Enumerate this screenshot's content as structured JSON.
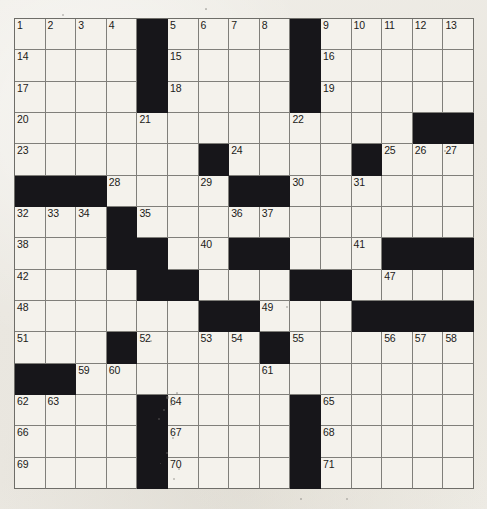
{
  "puzzle": {
    "kind": "crossword-grid",
    "title": "Crossword Puzzle Grid",
    "rows": 15,
    "columns": 15,
    "colors": {
      "block": "#17161a",
      "cell": "#f4f2ec",
      "grid_line": "#807f7a",
      "border": "#6e6d68",
      "paper": "#eceae4",
      "number_text": "#1b1a18"
    },
    "highest_number": 71,
    "layout": [
      "....#....#.....",
      "....#....#.....",
      "....#....#.....",
      ".............##",
      "......#....#...",
      "###....##......",
      "...#...........",
      "...##..##...###",
      "....##...##....",
      "......##...####",
      "...#....#......",
      "##.............",
      "....#....#.....",
      "....#....#.....",
      "....#....#....."
    ],
    "numbers": [
      {
        "n": 1,
        "row": 1,
        "col": 1
      },
      {
        "n": 2,
        "row": 1,
        "col": 2
      },
      {
        "n": 3,
        "row": 1,
        "col": 3
      },
      {
        "n": 4,
        "row": 1,
        "col": 4
      },
      {
        "n": 5,
        "row": 1,
        "col": 6
      },
      {
        "n": 6,
        "row": 1,
        "col": 7
      },
      {
        "n": 7,
        "row": 1,
        "col": 8
      },
      {
        "n": 8,
        "row": 1,
        "col": 9
      },
      {
        "n": 9,
        "row": 1,
        "col": 11
      },
      {
        "n": 10,
        "row": 1,
        "col": 12
      },
      {
        "n": 11,
        "row": 1,
        "col": 13
      },
      {
        "n": 12,
        "row": 1,
        "col": 14
      },
      {
        "n": 13,
        "row": 1,
        "col": 15
      },
      {
        "n": 14,
        "row": 2,
        "col": 1
      },
      {
        "n": 15,
        "row": 2,
        "col": 6
      },
      {
        "n": 16,
        "row": 2,
        "col": 11
      },
      {
        "n": 17,
        "row": 3,
        "col": 1
      },
      {
        "n": 18,
        "row": 3,
        "col": 6
      },
      {
        "n": 19,
        "row": 3,
        "col": 11
      },
      {
        "n": 20,
        "row": 4,
        "col": 1
      },
      {
        "n": 21,
        "row": 4,
        "col": 5
      },
      {
        "n": 22,
        "row": 4,
        "col": 10
      },
      {
        "n": 23,
        "row": 5,
        "col": 1
      },
      {
        "n": 24,
        "row": 5,
        "col": 8
      },
      {
        "n": 25,
        "row": 5,
        "col": 13
      },
      {
        "n": 26,
        "row": 5,
        "col": 14
      },
      {
        "n": 27,
        "row": 5,
        "col": 15
      },
      {
        "n": 28,
        "row": 6,
        "col": 4
      },
      {
        "n": 29,
        "row": 6,
        "col": 7
      },
      {
        "n": 30,
        "row": 6,
        "col": 10
      },
      {
        "n": 31,
        "row": 6,
        "col": 12
      },
      {
        "n": 32,
        "row": 7,
        "col": 1
      },
      {
        "n": 33,
        "row": 7,
        "col": 2
      },
      {
        "n": 34,
        "row": 7,
        "col": 3
      },
      {
        "n": 35,
        "row": 7,
        "col": 5
      },
      {
        "n": 36,
        "row": 7,
        "col": 8
      },
      {
        "n": 37,
        "row": 7,
        "col": 9
      },
      {
        "n": 38,
        "row": 8,
        "col": 1
      },
      {
        "n": 39,
        "row": 8,
        "col": 4
      },
      {
        "n": 40,
        "row": 8,
        "col": 7
      },
      {
        "n": 41,
        "row": 8,
        "col": 12
      },
      {
        "n": 42,
        "row": 9,
        "col": 1
      },
      {
        "n": 43,
        "row": 9,
        "col": 5
      },
      {
        "n": 44,
        "row": 9,
        "col": 6
      },
      {
        "n": 45,
        "row": 9,
        "col": 10
      },
      {
        "n": 46,
        "row": 9,
        "col": 11
      },
      {
        "n": 47,
        "row": 9,
        "col": 13
      },
      {
        "n": 48,
        "row": 10,
        "col": 1
      },
      {
        "n": 49,
        "row": 10,
        "col": 9
      },
      {
        "n": 50,
        "row": 10,
        "col": 12
      },
      {
        "n": 51,
        "row": 11,
        "col": 1
      },
      {
        "n": 52,
        "row": 11,
        "col": 5
      },
      {
        "n": 53,
        "row": 11,
        "col": 7
      },
      {
        "n": 54,
        "row": 11,
        "col": 8
      },
      {
        "n": 55,
        "row": 11,
        "col": 10
      },
      {
        "n": 56,
        "row": 11,
        "col": 13
      },
      {
        "n": 57,
        "row": 11,
        "col": 14
      },
      {
        "n": 58,
        "row": 11,
        "col": 15
      },
      {
        "n": 59,
        "row": 12,
        "col": 3
      },
      {
        "n": 60,
        "row": 12,
        "col": 4
      },
      {
        "n": 61,
        "row": 12,
        "col": 9
      },
      {
        "n": 62,
        "row": 13,
        "col": 1
      },
      {
        "n": 63,
        "row": 13,
        "col": 2
      },
      {
        "n": 64,
        "row": 13,
        "col": 6
      },
      {
        "n": 65,
        "row": 13,
        "col": 11
      },
      {
        "n": 66,
        "row": 14,
        "col": 1
      },
      {
        "n": 67,
        "row": 14,
        "col": 6
      },
      {
        "n": 68,
        "row": 14,
        "col": 11
      },
      {
        "n": 69,
        "row": 15,
        "col": 1
      },
      {
        "n": 70,
        "row": 15,
        "col": 6
      },
      {
        "n": 71,
        "row": 15,
        "col": 11
      }
    ],
    "entries": []
  }
}
